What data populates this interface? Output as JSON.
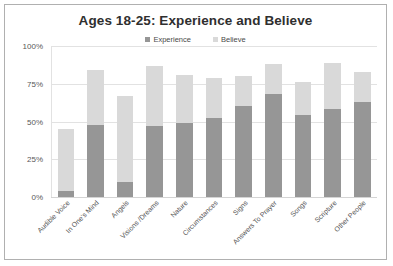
{
  "chart_data": {
    "type": "bar",
    "subtype": "stacked-column",
    "title": "Ages 18-25: Experience and Believe",
    "xlabel": "",
    "ylabel": "",
    "ylim": [
      0,
      100
    ],
    "ytick_labels": [
      "100%",
      "75%",
      "50%",
      "25%",
      "0%"
    ],
    "ytick_values": [
      100,
      75,
      50,
      25,
      0
    ],
    "grid": true,
    "legend_position": "top-center",
    "categories": [
      "Audible Voice",
      "In One's Mind",
      "Angels",
      "Visions /Dreams",
      "Nature",
      "Circumstances",
      "Signs",
      "Answers To Prayer",
      "Songs",
      "Scripture",
      "Other People"
    ],
    "series": [
      {
        "name": "Experience",
        "color": "#969696",
        "values": [
          4,
          48,
          10,
          47,
          49,
          52,
          60,
          68,
          54,
          58,
          63
        ]
      },
      {
        "name": "Believe",
        "color": "#d9d9d9",
        "values": [
          41,
          36,
          57,
          40,
          32,
          27,
          20,
          20,
          22,
          31,
          20
        ]
      }
    ],
    "totals": [
      45,
      84,
      67,
      87,
      81,
      79,
      80,
      88,
      76,
      89,
      83
    ]
  },
  "legend": {
    "items": [
      {
        "label": "Experience",
        "color": "#969696"
      },
      {
        "label": "Believe",
        "color": "#d9d9d9"
      }
    ]
  },
  "frame": {
    "border_color": "#b0b0b0",
    "background": "#ffffff",
    "gridline_color": "#e2e2e2"
  }
}
